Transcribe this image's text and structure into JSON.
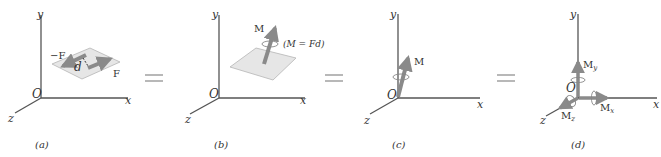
{
  "panels": [
    {
      "id": "a",
      "caption": "(a)",
      "axes": {
        "y": "y",
        "x": "x",
        "z": "z",
        "origin": "O"
      },
      "labels": {
        "neg_force": "−F",
        "force": "F",
        "distance": "d"
      }
    },
    {
      "id": "b",
      "caption": "(b)",
      "axes": {
        "y": "y",
        "x": "x",
        "z": "z",
        "origin": "O"
      },
      "labels": {
        "moment": "M",
        "equation": "(M = Fd)"
      }
    },
    {
      "id": "c",
      "caption": "(c)",
      "axes": {
        "y": "y",
        "x": "x",
        "z": "z",
        "origin": "O"
      },
      "labels": {
        "moment": "M"
      }
    },
    {
      "id": "d",
      "caption": "(d)",
      "axes": {
        "y": "y",
        "x": "x",
        "z": "z",
        "origin": "O"
      },
      "labels": {
        "my": "M",
        "my_sub": "y",
        "mx": "M",
        "mx_sub": "x",
        "mz": "M",
        "mz_sub": "z"
      }
    }
  ],
  "equals_sign": "=",
  "colors": {
    "axis": "#555555",
    "arrow": "#8a8a8a",
    "plane": "#e6e6e6",
    "plane_edge": "#b5b5b5",
    "text": "#333333"
  }
}
